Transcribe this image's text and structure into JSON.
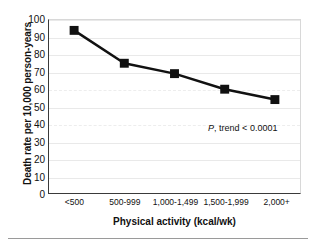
{
  "chart_data": {
    "type": "line",
    "title": "",
    "xlabel": "Physical activity (kcal/wk)",
    "ylabel": "Death rate per 10,000 person-years",
    "categories": [
      "<500",
      "500-999",
      "1,000-1,499",
      "1,500-1,999",
      "2,000+"
    ],
    "values": [
      94,
      75,
      69,
      60,
      54
    ],
    "series": [
      {
        "name": "Death rate",
        "values": [
          94,
          75,
          69,
          60,
          54
        ]
      }
    ],
    "ylim": [
      0,
      100
    ],
    "yticks": [
      0,
      10,
      20,
      30,
      40,
      50,
      60,
      70,
      80,
      90,
      100
    ],
    "ytick_labels": [
      "0",
      "10",
      "20",
      "30",
      "40",
      "50",
      "60",
      "70",
      "80",
      "90",
      "100"
    ],
    "grid": true,
    "grid_axis": "y",
    "legend": "none",
    "annotations": [
      {
        "text_italic": "P",
        "text": ", trend < 0.0001",
        "full_text": "P, trend < 0.0001",
        "x_category_index": 3,
        "y_value": 38
      }
    ],
    "marker": "square",
    "marker_color": "#111111",
    "line_color": "#111111",
    "line_width": 2.5
  },
  "colors": {
    "line": "#111111",
    "marker": "#111111",
    "axis": "#3a3a3a",
    "grid": "#e9e9e9",
    "grid_dashed": "#ededed",
    "text": "#111111",
    "background": "#ffffff",
    "footer_rule": "#9a9a9a"
  }
}
